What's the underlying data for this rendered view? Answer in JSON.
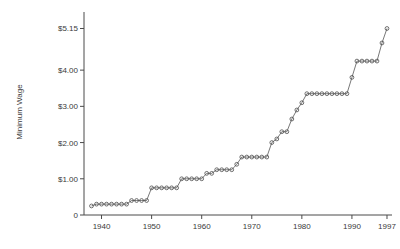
{
  "chart_data": {
    "type": "line",
    "title": "",
    "xlabel": "",
    "ylabel": "Minimum Wage",
    "xlim": [
      1936.5,
      1998.0
    ],
    "ylim": [
      0,
      5.55
    ],
    "xticks": [
      1940,
      1950,
      1960,
      1970,
      1980,
      1990,
      1997
    ],
    "xticklabels": [
      "1940",
      "1950",
      "1960",
      "1970",
      "1980",
      "1990",
      "1997"
    ],
    "yticks": [
      0,
      1.0,
      2.0,
      3.0,
      4.0,
      5.15
    ],
    "yticklabels": [
      "0",
      "$1.00",
      "$2.00",
      "$3.00",
      "$4.00",
      "$5.15"
    ],
    "grid": false,
    "legend": "none",
    "marker": "open-circle",
    "marker_color": "#4d4d4d",
    "line_color": "#555555",
    "x": [
      1938,
      1939,
      1940,
      1941,
      1942,
      1943,
      1944,
      1945,
      1946,
      1947,
      1948,
      1949,
      1950,
      1951,
      1952,
      1953,
      1954,
      1955,
      1956,
      1957,
      1958,
      1959,
      1960,
      1961,
      1962,
      1963,
      1964,
      1965,
      1966,
      1967,
      1968,
      1969,
      1970,
      1971,
      1972,
      1973,
      1974,
      1975,
      1976,
      1977,
      1978,
      1979,
      1980,
      1981,
      1982,
      1983,
      1984,
      1985,
      1986,
      1987,
      1988,
      1989,
      1990,
      1991,
      1992,
      1993,
      1994,
      1995,
      1996,
      1997
    ],
    "y": [
      0.25,
      0.3,
      0.3,
      0.3,
      0.3,
      0.3,
      0.3,
      0.3,
      0.4,
      0.4,
      0.4,
      0.4,
      0.75,
      0.75,
      0.75,
      0.75,
      0.75,
      0.75,
      1.0,
      1.0,
      1.0,
      1.0,
      1.0,
      1.15,
      1.15,
      1.25,
      1.25,
      1.25,
      1.25,
      1.4,
      1.6,
      1.6,
      1.6,
      1.6,
      1.6,
      1.6,
      2.0,
      2.1,
      2.3,
      2.3,
      2.65,
      2.9,
      3.1,
      3.35,
      3.35,
      3.35,
      3.35,
      3.35,
      3.35,
      3.35,
      3.35,
      3.35,
      3.8,
      4.25,
      4.25,
      4.25,
      4.25,
      4.25,
      4.75,
      5.15
    ],
    "series": [
      {
        "name": "Federal minimum wage",
        "values": [
          0.25,
          0.3,
          0.3,
          0.3,
          0.3,
          0.3,
          0.3,
          0.3,
          0.4,
          0.4,
          0.4,
          0.4,
          0.75,
          0.75,
          0.75,
          0.75,
          0.75,
          0.75,
          1.0,
          1.0,
          1.0,
          1.0,
          1.0,
          1.15,
          1.15,
          1.25,
          1.25,
          1.25,
          1.25,
          1.4,
          1.6,
          1.6,
          1.6,
          1.6,
          1.6,
          1.6,
          2.0,
          2.1,
          2.3,
          2.3,
          2.65,
          2.9,
          3.1,
          3.35,
          3.35,
          3.35,
          3.35,
          3.35,
          3.35,
          3.35,
          3.35,
          3.35,
          3.8,
          4.25,
          4.25,
          4.25,
          4.25,
          4.25,
          4.75,
          5.15
        ]
      }
    ]
  }
}
